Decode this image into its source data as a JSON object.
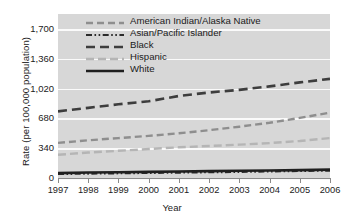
{
  "chart_data": {
    "type": "line",
    "title": "",
    "xlabel": "Year",
    "ylabel": "Rate (per 100,000 population)",
    "x": [
      1997,
      1998,
      1999,
      2000,
      2001,
      2002,
      2003,
      2004,
      2005,
      2006
    ],
    "xtick_labels": [
      "1997",
      "1998",
      "1999",
      "2000",
      "2001",
      "2002",
      "2003",
      "2004",
      "2005",
      "2006"
    ],
    "ytick_labels": [
      "1,700",
      "1,360",
      "1,020",
      "680",
      "340",
      "0"
    ],
    "ytick_values": [
      1700,
      1360,
      1020,
      680,
      340,
      0
    ],
    "ylim": [
      0,
      1870
    ],
    "xlim": [
      1997,
      2006
    ],
    "grid": "horizontal",
    "legend_position": "inside-top-left",
    "plot_background": "#d7d7d7",
    "gridline_color": "#fafafa",
    "series": [
      {
        "name": "American Indian/Alaska Native",
        "values": [
          400,
          430,
          455,
          480,
          510,
          545,
          585,
          630,
          685,
          745
        ],
        "color": "#8e8e8e",
        "style": "dashed",
        "dasharray": "7,4",
        "width": 2.4
      },
      {
        "name": "Asian/Pacific Islander",
        "values": [
          46,
          50,
          54,
          58,
          62,
          66,
          70,
          75,
          80,
          85
        ],
        "color": "#2b2b2b",
        "style": "dash-dot-dot",
        "dasharray": "6,2.5,1.6,2.5,1.6,2.5",
        "width": 2.2
      },
      {
        "name": "Black",
        "values": [
          760,
          800,
          840,
          875,
          935,
          975,
          1005,
          1045,
          1090,
          1130
        ],
        "color": "#3d3d3d",
        "style": "dashed",
        "dasharray": "9,5",
        "width": 2.6
      },
      {
        "name": "Hispanic",
        "values": [
          265,
          290,
          310,
          330,
          350,
          365,
          380,
          398,
          422,
          455
        ],
        "color": "#b5b5b5",
        "style": "dashed",
        "dasharray": "8,4",
        "width": 2.4
      },
      {
        "name": "White",
        "values": [
          56,
          62,
          66,
          70,
          74,
          78,
          82,
          86,
          90,
          95
        ],
        "color": "#1f1f1f",
        "style": "solid",
        "dasharray": "",
        "width": 2.6
      }
    ]
  },
  "legend": {
    "items": [
      {
        "label": "American Indian/Alaska Native"
      },
      {
        "label": "Asian/Pacific Islander"
      },
      {
        "label": "Black"
      },
      {
        "label": "Hispanic"
      },
      {
        "label": "White"
      }
    ]
  }
}
